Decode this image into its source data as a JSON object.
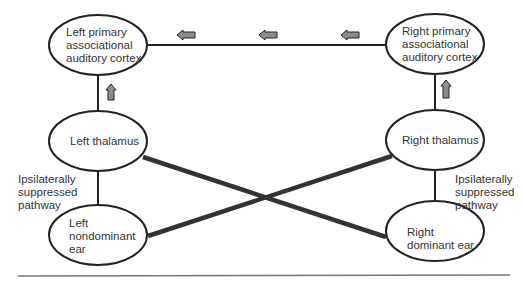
{
  "nodes": {
    "left_cortex": {
      "line1": "Left primary",
      "line2": "associational",
      "line3": "auditory cortex"
    },
    "right_cortex": {
      "line1": "Right primary",
      "line2": "associational",
      "line3": "auditory cortex"
    },
    "left_thalamus": {
      "label": "Left thalamus"
    },
    "right_thalamus": {
      "label": "Right thalamus"
    },
    "left_ear": {
      "line1": "Left",
      "line2": "nondominant",
      "line3": "ear"
    },
    "right_ear": {
      "line1": "Right",
      "line2": "dominant ear"
    }
  },
  "annotations": {
    "left_pathway": {
      "line1": "Ipsilaterally",
      "line2": "suppressed",
      "line3": "pathway"
    },
    "right_pathway": {
      "line1": "Ipsilaterally",
      "line2": "suppressed",
      "line3": "pathway"
    }
  },
  "colors": {
    "stroke": "#222222",
    "arrow_fill": "#8c8c8c",
    "rule": "#777777"
  }
}
